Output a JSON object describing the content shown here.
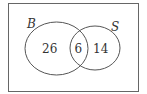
{
  "diagram": {
    "type": "venn",
    "universe": {
      "border_color": "#555555"
    },
    "sets": [
      {
        "label": "B",
        "only_count": "26"
      },
      {
        "label": "S",
        "only_count": "14"
      }
    ],
    "intersection": {
      "count": "6"
    },
    "line_color": "#555555",
    "text_color": "#333333"
  }
}
